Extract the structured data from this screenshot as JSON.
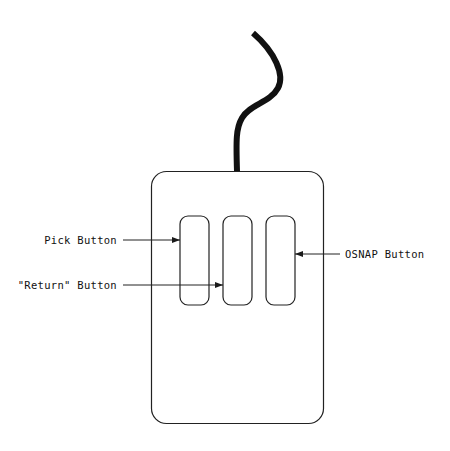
{
  "diagram": {
    "labels": {
      "pick": "Pick Button",
      "return": "\"Return\" Button",
      "osnap": "OSNAP Button"
    },
    "colors": {
      "line": "#1a1a1a",
      "background": "#ffffff"
    }
  }
}
